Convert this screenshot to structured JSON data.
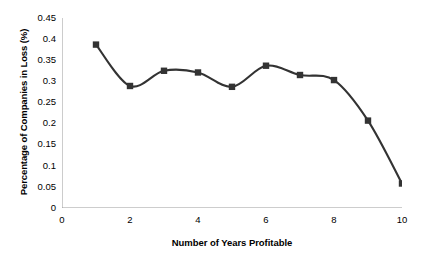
{
  "chart_data": {
    "type": "line",
    "title": "",
    "subtitle": "",
    "xlabel": "Number of Years Profitable",
    "ylabel": "Percentage of Companies in Loss (%)",
    "x": [
      1,
      2,
      3,
      4,
      5,
      6,
      7,
      8,
      9,
      10
    ],
    "values": [
      0.387,
      0.289,
      0.325,
      0.321,
      0.287,
      0.337,
      0.315,
      0.303,
      0.207,
      0.058
    ],
    "series": [
      {
        "name": "Percentage of Companies in Loss (%)",
        "x": [
          1,
          2,
          3,
          4,
          5,
          6,
          7,
          8,
          9,
          10
        ],
        "values": [
          0.387,
          0.289,
          0.325,
          0.321,
          0.287,
          0.337,
          0.315,
          0.303,
          0.207,
          0.058
        ]
      }
    ],
    "xlim": [
      0,
      10
    ],
    "ylim": [
      0,
      0.45
    ],
    "xticks": [
      0,
      2,
      4,
      6,
      8,
      10
    ],
    "xtick_labels": [
      "0",
      "2",
      "4",
      "6",
      "8",
      "10"
    ],
    "xminor_ticks": [
      1,
      3,
      5,
      7,
      9
    ],
    "yticks": [
      0,
      0.05,
      0.1,
      0.15,
      0.2,
      0.25,
      0.3,
      0.35,
      0.4,
      0.45
    ],
    "ytick_labels": [
      "0",
      "0.05",
      "0.1",
      "0.15",
      "0.2",
      "0.25",
      "0.3",
      "0.35",
      "0.4",
      "0.45"
    ],
    "grid": false,
    "legend": false,
    "legend_position": "none",
    "marker": "square",
    "line_color": "#333333",
    "marker_color": "#333333",
    "axis_color": "#9a9a9a",
    "background_color": "#ffffff",
    "annotations": []
  }
}
